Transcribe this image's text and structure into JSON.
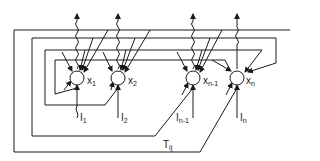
{
  "diagram": {
    "type": "hopfield-network",
    "neurons": [
      {
        "id": "x1",
        "label": "x",
        "sub": "1",
        "input_label": "I",
        "input_sub": "1"
      },
      {
        "id": "x2",
        "label": "x",
        "sub": "2",
        "input_label": "I",
        "input_sub": "2"
      },
      {
        "id": "xn-1",
        "label": "x",
        "sub": "n-1",
        "input_label": "I",
        "input_sub": "n-1"
      },
      {
        "id": "xn",
        "label": "x",
        "sub": "n",
        "input_label": "I",
        "input_sub": "n"
      }
    ],
    "weights_label": {
      "label": "T",
      "sub": "ij"
    },
    "colors": {
      "stroke": "#1a1a1a",
      "background": "#ffffff"
    }
  }
}
